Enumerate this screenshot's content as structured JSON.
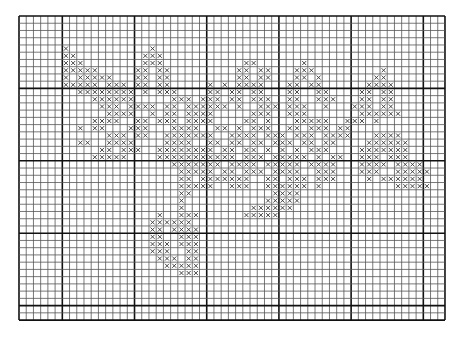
{
  "pattern": {
    "title": "Cross-stitch chart",
    "grid": {
      "origin_x": 19,
      "origin_y": 16,
      "cell_w": 7.22,
      "cell_h": 7.24,
      "cols": 59,
      "rows": 42,
      "major_every": 10,
      "major_col_offset": 6,
      "major_row_offset": 0,
      "minor_line_color": "#555555",
      "major_line_color": "#111111",
      "stitch_color": "#333333",
      "background": "#ffffff"
    },
    "stitch_symbol": "x",
    "rows": [
      "...........................................................",
      "...........................................................",
      "...........................................................",
      "...........................................................",
      "......x...........x........................................",
      "......xx.........xxx.......................................",
      "......xxx........xxx...........xx......x...................",
      "......xxxxx.....xx.xx.........xx.xx...xxx.........x........",
      "......x.xxxxx...xx.xx.........xx.xx...xx.x.......xx........",
      "......xxxxx.xxx.xx.xx.....x.x.xxxx...xx.xx......xxxx.......",
      "........xxxxxxxx.x.xxx....xx.xx.xx...xx..xx....xx.xx.......",
      "..........xxxxxx.....xxx.xxx.xx.xxx..xx..xxx...xx.xx.......",
      "...........xxx.xxxx.xx.xxxxxx.x..xxx.xxx..x...xxx.xx.......",
      "............xxxx..x.xx.xxxx.....xxx..xxx.......xxxxxx......",
      "..........xxxx..xx.xxx.xxxx....xx.x...xxxxx..xxx.x.........",
      "........x.xx...xxx...xxxx..xx.x.xxx..xx.xxx.xx.............",
      "............xxx.xx..xxxxxxx..xxxx.xxx.xxx.xxxx...xxxx......",
      "........xx..xxxx....xxxx..xx.xx.xx.xxx.xx.xx....xxxxxx.....",
      "...........xx.xxx..xxxxxxxx.xx.xx.x.x.x.xxx....xxxxxxx.....",
      "..........xxxxx....xxxxxxxxxxx.xxx.xxxxx.x.xx..xxx.xxx.....",
      ".....................xxxxxxx.xxxx.xxxxx.xxxx...xxxx.xxxx....",
      "......................xxxxx.xx.xxx.xxxx..xxx...xxx..xxxxx...",
      "......................xx.xxxxxxx..xx.xxx.xxx....x.xxxxxx...",
      "......................xxxxx..xxx..xxxxxx.x..........xxxxx..",
      "......................xx...........xxxx.....................",
      "......................x...........xxxxx.....................",
      "......................x.........xxxxxx......................",
      "...................x..xxx......xxxxx........................",
      "..................xxxxxx...................................",
      "..................xx.xxxx..................................",
      "..................xx..xxx..................................",
      "..................xxx.xxx..................................",
      "..................xxx..xx..................................",
      "...................xxx.xx..................................",
      "....................xxxxx..................................",
      "......................xxx..................................",
      "...........................................................",
      "...........................................................",
      "...........................................................",
      "...........................................................",
      "...........................................................",
      "..........................................................."
    ]
  }
}
